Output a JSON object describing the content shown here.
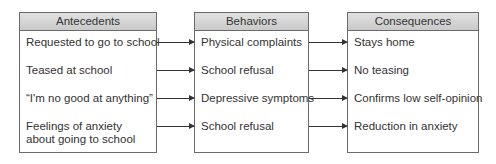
{
  "columns": [
    {
      "title": "Antecedents",
      "items": [
        "Requested to go to school",
        "Teased at school",
        "“I'm no good at anything”",
        "Feelings of anxiety about going to school"
      ]
    },
    {
      "title": "Behaviors",
      "items": [
        "Physical complaints",
        "School refusal",
        "Depressive symptoms",
        "School refusal"
      ]
    },
    {
      "title": "Consequences",
      "items": [
        "Stays home",
        "No teasing",
        "Confirms low self-opinion",
        "Reduction in anxiety"
      ]
    }
  ],
  "colors": {
    "border": "#6a6a6a",
    "header_bg": "#d4d4d4",
    "text": "#333333",
    "arrow": "#333333"
  }
}
